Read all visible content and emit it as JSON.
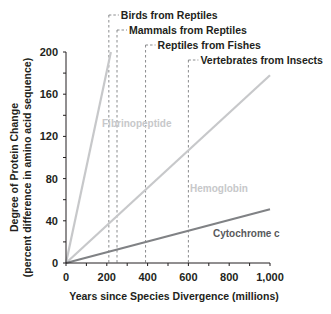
{
  "chart_data": {
    "type": "line",
    "title": "",
    "xlabel": "Years since Species Divergence (millions)",
    "ylabel": "Degree of Protein Change",
    "ylabel_sub": "(percent difference in amino acid sequence)",
    "xlim": [
      0,
      1000
    ],
    "ylim": [
      0,
      200
    ],
    "x_ticks": [
      0,
      200,
      400,
      600,
      800,
      1000
    ],
    "x_tick_labels": [
      "0",
      "200",
      "400",
      "600",
      "800",
      "1,000"
    ],
    "y_ticks": [
      0,
      40,
      80,
      120,
      160,
      200
    ],
    "y_tick_labels": [
      "0",
      "40",
      "80",
      "120",
      "160",
      "200"
    ],
    "grid": false,
    "legend": "none (inline labels)",
    "series": [
      {
        "name": "Fibrinopeptide",
        "x": [
          0,
          220
        ],
        "y": [
          0,
          200
        ],
        "color": "#c7c8ca"
      },
      {
        "name": "Hemoglobin",
        "x": [
          0,
          1000
        ],
        "y": [
          0,
          178
        ],
        "color": "#c7c8ca"
      },
      {
        "name": "Cytochrome c",
        "x": [
          0,
          1000
        ],
        "y": [
          0,
          51
        ],
        "color": "#808285"
      }
    ],
    "annotations": [
      {
        "label": "Birds from Reptiles",
        "x": 210
      },
      {
        "label": "Mammals from Reptiles",
        "x": 250
      },
      {
        "label": "Reptiles from Fishes",
        "x": 390
      },
      {
        "label": "Vertebrates from Insects",
        "x": 600
      }
    ]
  }
}
